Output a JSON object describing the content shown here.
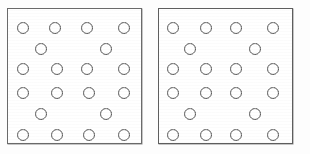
{
  "figure": {
    "background_color": "#fdfdfd",
    "panel_fill_color": "#ffffff",
    "panel_border_color": "#5e5e5e",
    "circle_stroke_color": "#3a3a3a",
    "panel_count": 2,
    "circles_per_panel": 20,
    "circle_diameter_px": 12,
    "row_pattern": [
      4,
      2,
      4,
      4,
      2,
      4
    ],
    "panels": [
      {
        "id": "panel-left",
        "label": "",
        "x": 7,
        "y": 8,
        "width": 135,
        "height": 136,
        "circle_count": 20,
        "circles": [
          {
            "cx": 22,
            "cy": 27
          },
          {
            "cx": 54,
            "cy": 27
          },
          {
            "cx": 86,
            "cy": 27
          },
          {
            "cx": 123,
            "cy": 27
          },
          {
            "cx": 40,
            "cy": 48
          },
          {
            "cx": 105,
            "cy": 48
          },
          {
            "cx": 22,
            "cy": 68
          },
          {
            "cx": 56,
            "cy": 68
          },
          {
            "cx": 86,
            "cy": 68
          },
          {
            "cx": 123,
            "cy": 68
          },
          {
            "cx": 22,
            "cy": 92
          },
          {
            "cx": 56,
            "cy": 92
          },
          {
            "cx": 88,
            "cy": 92
          },
          {
            "cx": 123,
            "cy": 92
          },
          {
            "cx": 40,
            "cy": 113
          },
          {
            "cx": 105,
            "cy": 113
          },
          {
            "cx": 22,
            "cy": 134
          },
          {
            "cx": 56,
            "cy": 134
          },
          {
            "cx": 88,
            "cy": 134
          },
          {
            "cx": 123,
            "cy": 134
          }
        ]
      },
      {
        "id": "panel-right",
        "label": "",
        "x": 158,
        "y": 8,
        "width": 135,
        "height": 136,
        "circle_count": 20,
        "circles": [
          {
            "cx": 172,
            "cy": 27
          },
          {
            "cx": 205,
            "cy": 27
          },
          {
            "cx": 235,
            "cy": 27
          },
          {
            "cx": 272,
            "cy": 27
          },
          {
            "cx": 189,
            "cy": 48
          },
          {
            "cx": 254,
            "cy": 48
          },
          {
            "cx": 172,
            "cy": 68
          },
          {
            "cx": 205,
            "cy": 68
          },
          {
            "cx": 235,
            "cy": 68
          },
          {
            "cx": 272,
            "cy": 68
          },
          {
            "cx": 172,
            "cy": 92
          },
          {
            "cx": 205,
            "cy": 92
          },
          {
            "cx": 235,
            "cy": 92
          },
          {
            "cx": 272,
            "cy": 92
          },
          {
            "cx": 189,
            "cy": 113
          },
          {
            "cx": 254,
            "cy": 113
          },
          {
            "cx": 172,
            "cy": 134
          },
          {
            "cx": 205,
            "cy": 134
          },
          {
            "cx": 235,
            "cy": 134
          },
          {
            "cx": 272,
            "cy": 134
          }
        ]
      }
    ]
  }
}
